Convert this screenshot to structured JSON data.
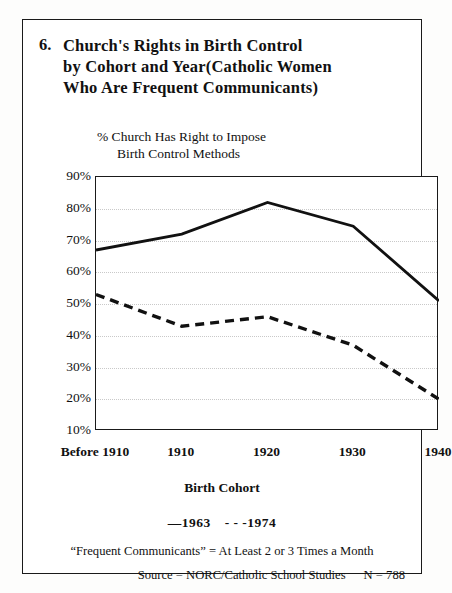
{
  "figure": {
    "number": "6.",
    "title_lines": [
      "Church's Rights in Birth Control",
      "by Cohort and Year(Catholic Women",
      "Who Are Frequent Communicants)"
    ],
    "subtitle_line1": "% Church Has Right to Impose",
    "subtitle_line2": "Birth Control Methods",
    "xaxis_title": "Birth Cohort",
    "legend_solid": "—1963",
    "legend_dashed": "- - -1974",
    "note": "“Frequent Communicants” = At Least 2 or 3 Times a Month",
    "source": "Source = NORC/Catholic School Studies",
    "n_label": "N = 788"
  },
  "chart_data": {
    "type": "line",
    "title": "Church's Rights in Birth Control by Cohort and Year(Catholic Women Who Are Frequent Communicants)",
    "xlabel": "Birth Cohort",
    "ylabel": "% Church Has Right to Impose Birth Control Methods",
    "categories": [
      "Before 1910",
      "1910",
      "1920",
      "1930",
      "1940"
    ],
    "ytick_labels": [
      "90%",
      "80%",
      "70%",
      "60%",
      "50%",
      "40%",
      "30%",
      "20%",
      "10%"
    ],
    "ytick_values": [
      90,
      80,
      70,
      60,
      50,
      40,
      30,
      20,
      10
    ],
    "ylim": [
      10,
      90
    ],
    "grid": true,
    "legend_position": "below-axis",
    "series": [
      {
        "name": "1963",
        "style": "solid",
        "color": "#111111",
        "values": [
          67,
          72,
          82,
          74.5,
          51
        ]
      },
      {
        "name": "1974",
        "style": "dashed",
        "color": "#111111",
        "values": [
          53,
          43,
          46,
          37,
          20
        ]
      }
    ]
  }
}
